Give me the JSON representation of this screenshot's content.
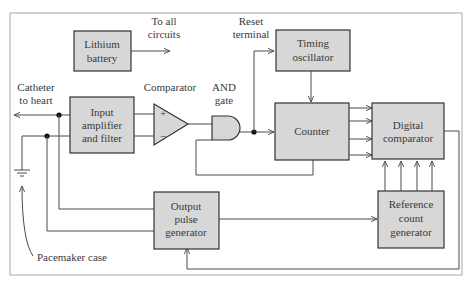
{
  "diagram": {
    "colors": {
      "box_fill": "#d7d7d7",
      "box_stroke": "#333333",
      "wire": "#4a4a4a",
      "frame": "#c4c4c4",
      "text": "#3a3a3a"
    },
    "blocks": {
      "lithium_battery": {
        "line1": "Lithium",
        "line2": "battery"
      },
      "timing_oscillator": {
        "line1": "Timing",
        "line2": "oscillator"
      },
      "input_amp": {
        "line1": "Input",
        "line2": "amplifier",
        "line3": "and filter"
      },
      "counter": {
        "line1": "Counter"
      },
      "digital_comparator": {
        "line1": "Digital",
        "line2": "comparator"
      },
      "output_pulse": {
        "line1": "Output",
        "line2": "pulse",
        "line3": "generator"
      },
      "reference_count": {
        "line1": "Reference",
        "line2": "count",
        "line3": "generator"
      }
    },
    "labels": {
      "to_all_circuits_1": "To all",
      "to_all_circuits_2": "circuits",
      "reset_terminal_1": "Reset",
      "reset_terminal_2": "terminal",
      "catheter_1": "Catheter",
      "catheter_2": "to heart",
      "comparator": "Comparator",
      "and_gate_1": "AND",
      "and_gate_2": "gate",
      "plus": "+",
      "minus": "−",
      "pacemaker_case": "Pacemaker case"
    }
  }
}
